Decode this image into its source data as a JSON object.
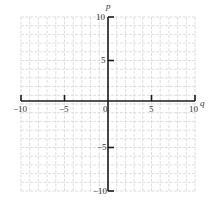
{
  "chart_data": {
    "type": "scatter",
    "title": "",
    "xlabel": "q",
    "ylabel": "p",
    "xlim": [
      -10,
      10
    ],
    "ylim": [
      -10,
      10
    ],
    "grid": true,
    "grid_step": 1,
    "x_ticks": [
      "-10",
      "-5",
      "0",
      "5",
      "10"
    ],
    "y_ticks": [
      "10",
      "5",
      "-5",
      "-10"
    ],
    "series": []
  },
  "axes": {
    "x_name": "q",
    "y_name": "p",
    "x_tick_labels": {
      "m10": "−10",
      "m5": "−5",
      "zero": "0",
      "p5": "5",
      "p10": "10"
    },
    "y_tick_labels": {
      "p10": "10",
      "p5": "5",
      "m5": "−5",
      "m10": "−10"
    }
  }
}
